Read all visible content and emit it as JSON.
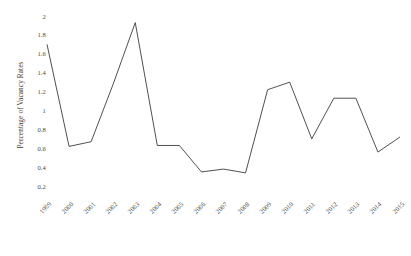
{
  "chart_data": {
    "type": "line",
    "title": "",
    "xlabel": "",
    "ylabel": "Percentage of Vacancy Rates",
    "categories": [
      "1999",
      "2000",
      "2001",
      "2002",
      "2003",
      "2004",
      "2005",
      "2006",
      "2007",
      "2008",
      "2009",
      "2010",
      "2011",
      "2012",
      "2013",
      "2014",
      "2015"
    ],
    "series": [
      {
        "name": "Vacancy Rate",
        "values": [
          1.7,
          0.62,
          0.67,
          1.28,
          1.93,
          0.63,
          0.63,
          0.35,
          0.38,
          0.34,
          1.22,
          1.3,
          0.7,
          1.13,
          1.13,
          0.56,
          0.72
        ]
      }
    ],
    "ylim": [
      0,
      2
    ],
    "xlim": [
      "1999",
      "2015"
    ],
    "y_ticks": [
      "0",
      "0.2",
      "0.4",
      "0.6",
      "0.8",
      "1",
      "1.2",
      "1.4",
      "1.6",
      "1.8",
      "2"
    ],
    "y_tick_values": [
      0,
      0.2,
      0.4,
      0.6,
      0.8,
      1,
      1.2,
      1.4,
      1.6,
      1.8,
      2
    ],
    "grid": false,
    "legend": "none",
    "line_color": "#3c3c3c",
    "background_color": "#ffffff"
  }
}
